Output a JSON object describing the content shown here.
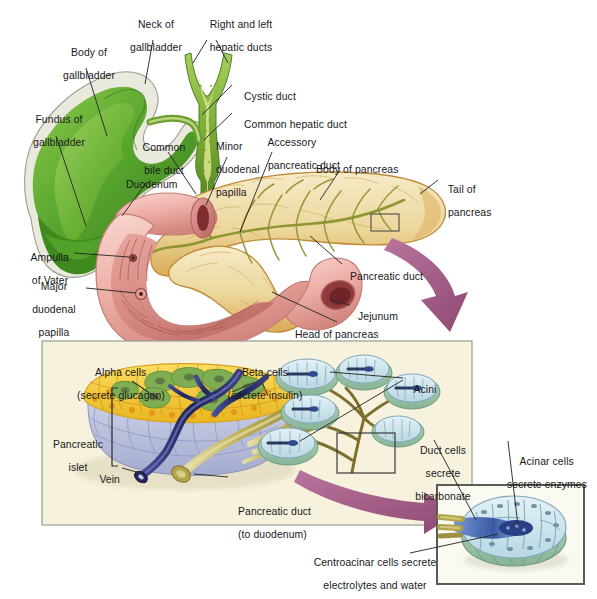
{
  "figure": {
    "colors": {
      "gallbladder_green": "#5aa832",
      "gallbladder_green_dark": "#3d7d1e",
      "duct_green": "#7fb03a",
      "duodenum_pink": "#f0b3ad",
      "duodenum_pink_dark": "#c9736c",
      "mucosa_red": "#8d3336",
      "pancreas_tan": "#e8c27e",
      "pancreas_cream": "#f2e4c0",
      "pancreas_outline": "#c28a3c",
      "arrow_mauve": "#a9618c",
      "panel_cream": "#f6f1dc",
      "panel_border": "#9a9a8f",
      "islet_yellow": "#f4c93c",
      "islet_green": "#7fae52",
      "islet_blue_gray": "#b8bedd",
      "vein_navy": "#2b2f6b",
      "duct_olive": "#b5a44a",
      "acini_pale": "#d6e8ef",
      "acini_green": "#9dc4ae",
      "acinar_lumen_blue": "#3f5fa8",
      "leader_line": "#2a2a2a",
      "text": "#18181a"
    },
    "labels": [
      {
        "id": "neck-of-gallbladder",
        "text": "Neck of\ngallbladder",
        "align": "center"
      },
      {
        "id": "right-and-left-hepatic-ducts",
        "text": "Right and left\nhepatic ducts",
        "align": "center"
      },
      {
        "id": "body-of-gallbladder",
        "text": "Body of\ngallbladder",
        "align": "center"
      },
      {
        "id": "cystic-duct",
        "text": "Cystic duct",
        "align": "left"
      },
      {
        "id": "common-hepatic-duct",
        "text": "Common hepatic duct",
        "align": "left"
      },
      {
        "id": "fundus-of-gallbladder",
        "text": "Fundus of\ngallbladder",
        "align": "center"
      },
      {
        "id": "common-bile-duct",
        "text": "Common\nbile duct",
        "align": "center"
      },
      {
        "id": "minor-duodenal-papilla",
        "text": "Minor\nduodenal\npapilla",
        "align": "left"
      },
      {
        "id": "accessory-pancreatic-duct",
        "text": "Accessory\npancreatic duct",
        "align": "left"
      },
      {
        "id": "body-of-pancreas",
        "text": "Body of pancreas",
        "align": "left"
      },
      {
        "id": "tail-of-pancreas",
        "text": "Tail of\npancreas",
        "align": "left"
      },
      {
        "id": "duodenum",
        "text": "Duodenum",
        "align": "left"
      },
      {
        "id": "ampulla-of-vater",
        "text": "Ampulla\nof Vater",
        "align": "center"
      },
      {
        "id": "major-duodenal-papilla",
        "text": "Major\nduodenal\npapilla",
        "align": "center"
      },
      {
        "id": "pancreatic-duct",
        "text": "Pancreatic duct",
        "align": "left"
      },
      {
        "id": "jejunum",
        "text": "Jejunum",
        "align": "left"
      },
      {
        "id": "head-of-pancreas",
        "text": "Head of pancreas",
        "align": "left"
      },
      {
        "id": "alpha-cells",
        "text": "Alpha cells\n(secrete glucagon)",
        "align": "center"
      },
      {
        "id": "beta-cells",
        "text": "Beta cells\n(secrete insulin)",
        "align": "center"
      },
      {
        "id": "acini",
        "text": "Acini",
        "align": "left"
      },
      {
        "id": "pancreatic-islet",
        "text": "Pancreatic\nislet",
        "align": "center"
      },
      {
        "id": "duct-cells-secrete-bicarbonate",
        "text": "Duct cells\nsecrete\nbicarbonate",
        "align": "center"
      },
      {
        "id": "acinar-cells-secrete-enzymes",
        "text": "Acinar cells\nsecrete enzymes",
        "align": "center"
      },
      {
        "id": "vein",
        "text": "Vein",
        "align": "right"
      },
      {
        "id": "pancreatic-duct-to-duodenum",
        "text": "Pancreatic duct\n(to duodenum)",
        "align": "left"
      },
      {
        "id": "centroacinar-cells",
        "text": "Centroacinar cells secrete\nelectrolytes and water",
        "align": "center"
      }
    ],
    "label_text": {
      "neck_of_gallbladder_l1": "Neck of",
      "neck_of_gallbladder_l2": "gallbladder",
      "hepatic_ducts_l1": "Right and left",
      "hepatic_ducts_l2": "hepatic ducts",
      "body_of_gallbladder_l1": "Body of",
      "body_of_gallbladder_l2": "gallbladder",
      "cystic_duct": "Cystic duct",
      "common_hepatic_duct": "Common hepatic duct",
      "fundus_of_gallbladder_l1": "Fundus of",
      "fundus_of_gallbladder_l2": "gallbladder",
      "common_bile_duct_l1": "Common",
      "common_bile_duct_l2": "bile duct",
      "minor_papilla_l1": "Minor",
      "minor_papilla_l2": "duodenal",
      "minor_papilla_l3": "papilla",
      "accessory_duct_l1": "Accessory",
      "accessory_duct_l2": "pancreatic duct",
      "body_of_pancreas": "Body of pancreas",
      "tail_of_pancreas_l1": "Tail of",
      "tail_of_pancreas_l2": "pancreas",
      "duodenum": "Duodenum",
      "ampulla_l1": "Ampulla",
      "ampulla_l2": "of Vater",
      "major_papilla_l1": "Major",
      "major_papilla_l2": "duodenal",
      "major_papilla_l3": "papilla",
      "pancreatic_duct": "Pancreatic duct",
      "jejunum": "Jejunum",
      "head_of_pancreas": "Head of pancreas",
      "alpha_cells_l1": "Alpha cells",
      "alpha_cells_l2": "(secrete glucagon)",
      "beta_cells_l1": "Beta cells",
      "beta_cells_l2": "(secrete insulin)",
      "acini": "Acini",
      "pancreatic_islet_l1": "Pancreatic",
      "pancreatic_islet_l2": "islet",
      "duct_cells_l1": "Duct cells",
      "duct_cells_l2": "secrete",
      "duct_cells_l3": "bicarbonate",
      "acinar_cells_l1": "Acinar cells",
      "acinar_cells_l2": "secrete enzymes",
      "vein": "Vein",
      "pancreatic_duct_inset_l1": "Pancreatic duct",
      "pancreatic_duct_inset_l2": "(to duodenum)",
      "centroacinar_l1": "Centroacinar cells secrete",
      "centroacinar_l2": "electrolytes and water"
    }
  }
}
